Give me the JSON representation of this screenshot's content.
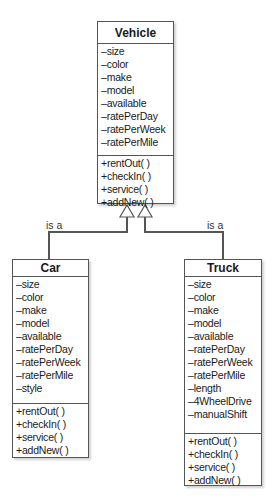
{
  "diagram": {
    "type": "UML class diagram (inheritance)",
    "relation_label": "is a",
    "classes": {
      "vehicle": {
        "name": "Vehicle",
        "attributes": [
          "–size",
          "–color",
          "–make",
          "–model",
          "–available",
          "–ratePerDay",
          "–ratePerWeek",
          "–ratePerMile"
        ],
        "methods": [
          "+rentOut( )",
          "+checkIn( )",
          "+service( )",
          "+addNew( )"
        ]
      },
      "car": {
        "name": "Car",
        "attributes": [
          "–size",
          "–color",
          "–make",
          "–model",
          "–available",
          "–ratePerDay",
          "–ratePerWeek",
          "–ratePerMile",
          "–style"
        ],
        "methods": [
          "+rentOut( )",
          "+checkIn( )",
          "+service( )",
          "+addNew( )"
        ]
      },
      "truck": {
        "name": "Truck",
        "attributes": [
          "–size",
          "–color",
          "–make",
          "–model",
          "–available",
          "–ratePerDay",
          "–ratePerWeek",
          "–ratePerMile",
          "–length",
          "–4WheelDrive",
          "–manualShift"
        ],
        "methods": [
          "+rentOut( )",
          "+checkIn( )",
          "+service( )",
          "+addNew( )"
        ]
      }
    },
    "relations": [
      {
        "from": "Car",
        "to": "Vehicle",
        "label": "is a",
        "kind": "generalization"
      },
      {
        "from": "Truck",
        "to": "Vehicle",
        "label": "is a",
        "kind": "generalization"
      }
    ],
    "colors": {
      "line": "#555555",
      "box_fill": "#ffffff",
      "text": "#1a1a1a"
    }
  }
}
